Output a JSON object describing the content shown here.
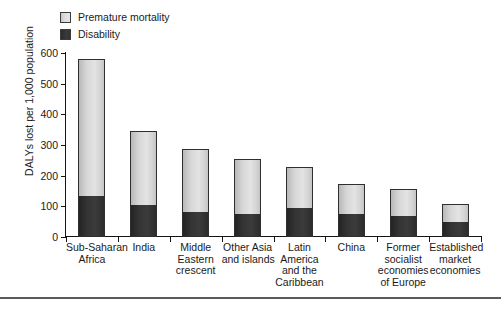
{
  "chart_data": {
    "type": "bar",
    "subtype": "stacked-vertical",
    "title": "",
    "subtitle": "",
    "xlabel": "",
    "ylabel": "DALYs lost per 1,000 population",
    "ylim": [
      0,
      600
    ],
    "yticks": [
      0,
      100,
      200,
      300,
      400,
      500,
      600
    ],
    "ytick_labels": [
      "0",
      "100",
      "200",
      "300",
      "400",
      "500",
      "600"
    ],
    "grid": false,
    "legend_position": "top-left",
    "categories": [
      "Sub-Saharan Africa",
      "India",
      "Middle Eastern crescent",
      "Other Asia and islands",
      "Latin America and the Caribbean",
      "China",
      "Former socialist economies of Europe",
      "Established market economies"
    ],
    "category_label_lines": [
      [
        "Sub-Saharan",
        "Africa"
      ],
      [
        "India"
      ],
      [
        "Middle",
        "Eastern",
        "crescent"
      ],
      [
        "Other Asia",
        "and islands"
      ],
      [
        "Latin",
        "America",
        "and the",
        "Caribbean"
      ],
      [
        "China"
      ],
      [
        "Former",
        "socialist",
        "economies",
        "of Europe"
      ],
      [
        "Established",
        "market",
        "economies"
      ]
    ],
    "series": [
      {
        "name": "Disability",
        "color": "#333333",
        "values": [
          135,
          105,
          80,
          75,
          95,
          75,
          70,
          50
        ]
      },
      {
        "name": "Premature mortality",
        "color": "#d9d9d9",
        "values": [
          445,
          240,
          207,
          180,
          133,
          98,
          88,
          58
        ]
      }
    ],
    "totals": [
      580,
      345,
      287,
      255,
      228,
      173,
      158,
      108
    ],
    "annotations": []
  },
  "legend": {
    "items": [
      {
        "label": "Premature mortality",
        "swatch": "legend-swatch-premature-mortality"
      },
      {
        "label": "Disability",
        "swatch": "legend-swatch-disability"
      }
    ]
  },
  "axes": {
    "y_title": "DALYs lost per 1,000 population"
  }
}
